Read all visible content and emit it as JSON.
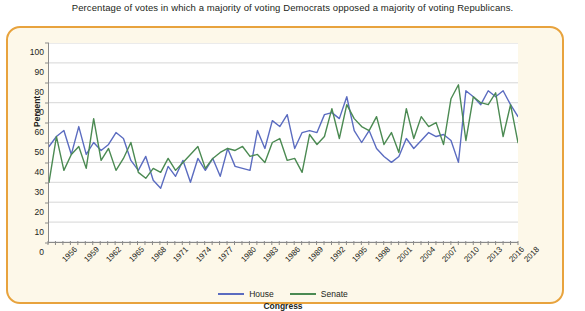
{
  "caption": "Percentage of votes in which a majority of voting Democrats opposed a majority of voting Republicans.",
  "legend": {
    "house_label": "House",
    "senate_label": "Senate",
    "house_color": "#5b6cc0",
    "senate_color": "#4b8a52"
  },
  "colors": {
    "card_background": "#fdf8e9",
    "card_border": "#e8a33d",
    "plot_background": "#ffffff",
    "gridline": "#d6d6d6",
    "axis": "#8a8a8a",
    "text": "#231f20"
  },
  "chart_data": {
    "type": "line",
    "title": "Percentage of votes in which a majority of voting Democrats opposed a majority of voting Republicans.",
    "xlabel": "Congress",
    "ylabel": "Percent",
    "ylim": [
      0,
      100
    ],
    "ytick_step": 10,
    "yticks": [
      0,
      10,
      20,
      30,
      40,
      50,
      60,
      70,
      80,
      90,
      100
    ],
    "grid": true,
    "legend_position": "bottom",
    "x": [
      1955,
      1956,
      1957,
      1958,
      1959,
      1960,
      1961,
      1962,
      1963,
      1964,
      1965,
      1966,
      1967,
      1968,
      1969,
      1970,
      1971,
      1972,
      1973,
      1974,
      1975,
      1976,
      1977,
      1978,
      1979,
      1980,
      1981,
      1982,
      1983,
      1984,
      1985,
      1986,
      1987,
      1988,
      1989,
      1990,
      1991,
      1992,
      1993,
      1994,
      1995,
      1996,
      1997,
      1998,
      1999,
      2000,
      2001,
      2002,
      2003,
      2004,
      2005,
      2006,
      2007,
      2008,
      2009,
      2010,
      2011,
      2012,
      2013,
      2014,
      2015,
      2016,
      2017,
      2018
    ],
    "xticklabels": [
      "1956",
      "1959",
      "1962",
      "1965",
      "1968",
      "1971",
      "1974",
      "1977",
      "1980",
      "1983",
      "1986",
      "1989",
      "1992",
      "1995",
      "1998",
      "2001",
      "2004",
      "2007",
      "2010",
      "2013",
      "2016",
      "2018"
    ],
    "xticklabel_years": [
      1956,
      1959,
      1962,
      1965,
      1968,
      1971,
      1974,
      1977,
      1980,
      1983,
      1986,
      1989,
      1992,
      1995,
      1998,
      2001,
      2004,
      2007,
      2010,
      2013,
      2016,
      2018
    ],
    "series": [
      {
        "name": "House",
        "color": "#5b6cc0",
        "values": [
          48,
          53,
          56,
          44,
          58,
          44,
          50,
          46,
          49,
          55,
          52,
          41,
          36,
          43,
          31,
          27,
          38,
          33,
          41,
          30,
          42,
          36,
          42,
          33,
          47,
          38,
          37,
          36,
          56,
          47,
          61,
          58,
          64,
          47,
          55,
          56,
          55,
          64,
          65,
          62,
          73,
          56,
          50,
          56,
          47,
          43,
          40,
          43,
          52,
          47,
          51,
          55,
          53,
          54,
          51,
          40,
          76,
          73,
          69,
          76,
          73,
          76,
          69,
          63
        ]
      },
      {
        "name": "Senate",
        "color": "#4b8a52",
        "values": [
          30,
          53,
          36,
          44,
          48,
          37,
          62,
          41,
          47,
          36,
          42,
          50,
          35,
          32,
          37,
          35,
          42,
          36,
          40,
          44,
          48,
          37,
          42,
          45,
          47,
          46,
          48,
          43,
          44,
          40,
          50,
          52,
          41,
          42,
          35,
          54,
          49,
          53,
          67,
          52,
          69,
          62,
          58,
          56,
          63,
          49,
          55,
          45,
          67,
          52,
          63,
          58,
          60,
          49,
          72,
          79,
          51,
          73,
          70,
          69,
          75,
          53,
          69,
          50
        ]
      }
    ]
  }
}
